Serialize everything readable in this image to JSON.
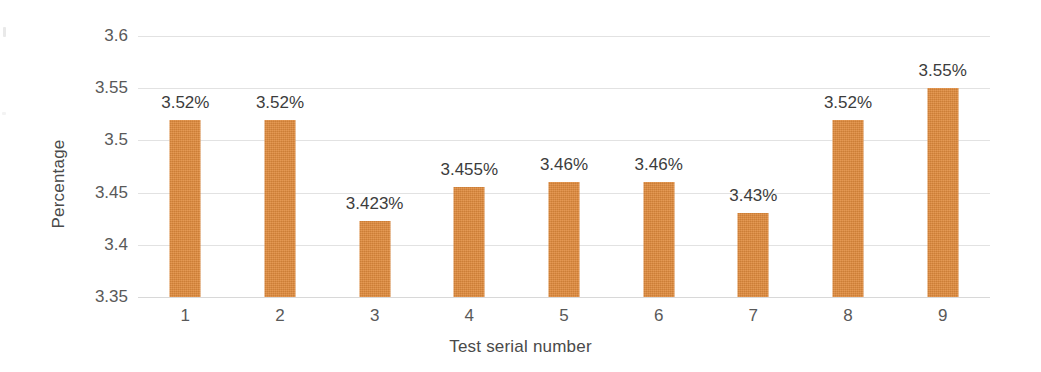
{
  "chart_data": {
    "type": "bar",
    "title": "",
    "xlabel": "Test serial number",
    "ylabel": "Percentage",
    "categories": [
      "1",
      "2",
      "3",
      "4",
      "5",
      "6",
      "7",
      "8",
      "9"
    ],
    "values": [
      3.52,
      3.52,
      3.423,
      3.455,
      3.46,
      3.46,
      3.43,
      3.52,
      3.55
    ],
    "data_labels": [
      "3.52%",
      "3.52%",
      "3.423%",
      "3.455%",
      "3.46%",
      "3.46%",
      "3.43%",
      "3.52%",
      "3.55%"
    ],
    "series": [
      {
        "name": "Percentage",
        "values": [
          3.52,
          3.52,
          3.423,
          3.455,
          3.46,
          3.46,
          3.43,
          3.52,
          3.55
        ],
        "color": "#e08a3c"
      }
    ],
    "ylim": [
      3.35,
      3.6
    ],
    "ytick_labels": [
      "3.6",
      "3.55",
      "3.5",
      "3.45",
      "3.4",
      "3.35"
    ],
    "ytick_values": [
      3.6,
      3.55,
      3.5,
      3.45,
      3.4,
      3.35
    ],
    "grid": true,
    "grid_axis": "y",
    "legend": false,
    "legend_position": "none",
    "bar_color": "#e08a3c",
    "gridline_color": "#e2e2e2",
    "axis_text_color": "#595959",
    "label_text_color": "#3c3c3c",
    "background_color": "#ffffff"
  }
}
